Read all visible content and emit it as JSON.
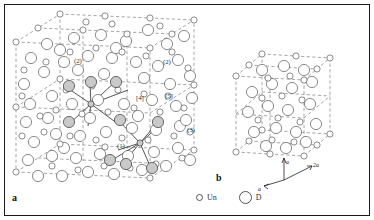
{
  "figure": {
    "type": "crystal-structure-diagram",
    "panels": [
      {
        "id": "a",
        "label": "a",
        "description": "Large perspective unit cell with dashed cell edges, open circles for two atom types and shaded circles marking coordination polyhedra around two central sites connected by bond lines",
        "site_labels": [
          "(2)",
          "(2)",
          "[4]",
          "[5]",
          "(3)",
          "(1)"
        ]
      },
      {
        "id": "b",
        "label": "b",
        "description": "Smaller perspective unit cell with dashed cell edges and open circles of two sizes",
        "axes": [
          {
            "name": "a-vertical",
            "label": "a"
          },
          {
            "name": "a-left",
            "label": "a"
          },
          {
            "name": "a-diagonal",
            "label": "2a"
          }
        ]
      }
    ]
  },
  "labels": {
    "panel_a": "a",
    "panel_b": "b",
    "site_2_upper": "(2)",
    "site_2_right": "(2)",
    "site_4": "[4]",
    "site_5": "[5]",
    "site_3": "(3)",
    "site_1": "(1)",
    "axis_a_vertical": "a",
    "axis_a_left": "a",
    "axis_2a": "2a"
  },
  "legend": {
    "items": [
      {
        "symbol": "small-open-circle",
        "label": "Un"
      },
      {
        "symbol": "large-open-circle",
        "label": "D"
      }
    ]
  },
  "colors": {
    "outline": "#555555",
    "shaded_fill": "#c9c9c9",
    "cell_edge": "#8a8a8a",
    "bond": "#222222",
    "frame": "#1a1a1a",
    "background": "#ffffff"
  }
}
